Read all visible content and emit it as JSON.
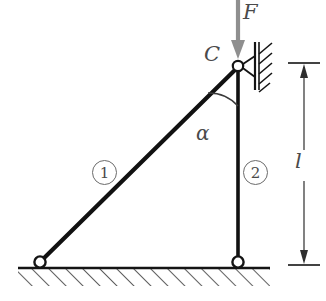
{
  "figure": {
    "background_color": "#ffffff",
    "width": 326,
    "height": 301,
    "labels": {
      "force": "F",
      "joint": "C",
      "angle": "α",
      "length": "l",
      "member_one": "1",
      "member_two": "2"
    },
    "colors": {
      "member_stroke": "#111111",
      "force_arrow": "#8c8c8c",
      "label_text": "#4a4a4a",
      "annotation_stroke": "#6b6b6b",
      "ground_hatch": "#2b2b2b"
    },
    "geometry": {
      "joint_c": [
        238,
        66
      ],
      "pin_left": [
        40,
        262
      ],
      "pin_right": [
        238,
        262
      ],
      "ground_line_y": 268,
      "ground_span": [
        18,
        270
      ],
      "wall_x": 256,
      "wall_span_y": [
        42,
        90
      ],
      "dimension_x": 304,
      "dimension_top_y": 63,
      "dimension_bottom_y": 265,
      "force_arrow_x": 238,
      "force_arrow_top_y": 0,
      "force_arrow_tip_y": 58,
      "angle_arc_radius": 40
    },
    "elements": {
      "member_one_name": "diagonal-bar-1",
      "member_two_name": "vertical-bar-2",
      "support_left": "pinned-support-left",
      "support_right": "pinned-support-right",
      "support_top": "wall-pin-support-c",
      "load": "downward-point-load-F",
      "dimension": "length-dimension-l"
    }
  }
}
